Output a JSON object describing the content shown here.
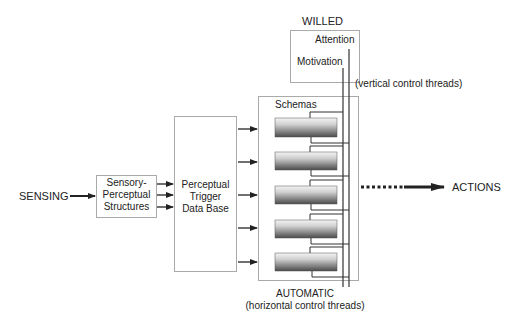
{
  "diagram": {
    "willed": {
      "title": "WILLED",
      "attention": "Attention",
      "motivation": "Motivation",
      "vertical_caption": "(vertical control threads)"
    },
    "sensing": "SENSING",
    "sensory_box": [
      "Sensory-",
      "Perceptual",
      "Structures"
    ],
    "trigger_box": [
      "Perceptual",
      "Trigger",
      "Data Base"
    ],
    "schemas": {
      "title": "Schemas",
      "count": 5
    },
    "actions": "ACTIONS",
    "automatic": {
      "title": "AUTOMATIC",
      "horizontal_caption": "(horizontal control threads)"
    },
    "colors": {
      "line": "#333333",
      "box_border": "#aaaaaa"
    }
  }
}
